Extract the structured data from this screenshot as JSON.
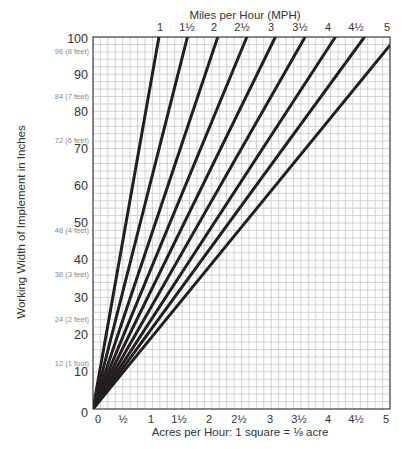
{
  "chart_data": {
    "type": "line",
    "title": "Miles per Hour (MPH)",
    "xlabel": "Acres per Hour: 1 square = ⅛ acre",
    "ylabel": "Working Width of Implement in Inches",
    "xlim": [
      0,
      5
    ],
    "ylim": [
      0,
      100
    ],
    "grid": true,
    "grid_x_step": 0.125,
    "grid_y_step": 2,
    "x_ticks": [
      0,
      0.5,
      1,
      1.5,
      2,
      2.5,
      3,
      3.5,
      4,
      4.5,
      5
    ],
    "x_tick_labels": [
      "0",
      "½",
      "1",
      "1½",
      "2",
      "2½",
      "3",
      "3½",
      "4",
      "4½",
      "5"
    ],
    "y_ticks": [
      0,
      10,
      20,
      30,
      40,
      50,
      60,
      70,
      80,
      90,
      100
    ],
    "y_tick_labels": [
      "0",
      "10",
      "20",
      "30",
      "40",
      "50",
      "60",
      "70",
      "80",
      "90",
      "100"
    ],
    "y_secondary_labels": [
      {
        "value": 96,
        "label": "96 (8 feet)"
      },
      {
        "value": 84,
        "label": "84 (7 feet)"
      },
      {
        "value": 72,
        "label": "72 (6 feet)"
      },
      {
        "value": 48,
        "label": "48 (4 feet)"
      },
      {
        "value": 36,
        "label": "36 (3 feet)"
      },
      {
        "value": 24,
        "label": "24 (2 feet)"
      },
      {
        "value": 12,
        "label": "12 (1 foot)"
      }
    ],
    "top_axis_labels": [
      "1",
      "1½",
      "2",
      "2½",
      "3",
      "3½",
      "4",
      "4½",
      "5"
    ],
    "series": [
      {
        "name": "1 MPH",
        "mph": 1,
        "x": [
          0,
          1.11
        ],
        "y": [
          0,
          100
        ]
      },
      {
        "name": "1½ MPH",
        "mph": 1.5,
        "x": [
          0,
          1.59
        ],
        "y": [
          0,
          100
        ]
      },
      {
        "name": "2 MPH",
        "mph": 2,
        "x": [
          0,
          2.1
        ],
        "y": [
          0,
          100
        ]
      },
      {
        "name": "2½ MPH",
        "mph": 2.5,
        "x": [
          0,
          2.59
        ],
        "y": [
          0,
          100
        ]
      },
      {
        "name": "3 MPH",
        "mph": 3,
        "x": [
          0,
          3.07
        ],
        "y": [
          0,
          100
        ]
      },
      {
        "name": "3½ MPH",
        "mph": 3.5,
        "x": [
          0,
          3.57
        ],
        "y": [
          0,
          100
        ]
      },
      {
        "name": "4 MPH",
        "mph": 4,
        "x": [
          0,
          4.08
        ],
        "y": [
          0,
          100
        ]
      },
      {
        "name": "4½ MPH",
        "mph": 4.5,
        "x": [
          0,
          4.57
        ],
        "y": [
          0,
          100
        ]
      },
      {
        "name": "5 MPH",
        "mph": 5,
        "x": [
          0,
          5.0
        ],
        "y": [
          0,
          97.8
        ]
      }
    ],
    "colors": {
      "line": "#231f20",
      "grid": "#c6c6c6",
      "border": "#3a3a3a"
    }
  }
}
